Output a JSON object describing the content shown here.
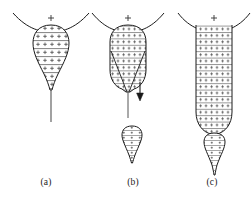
{
  "figure": {
    "title": "",
    "background_color": "#ffffff",
    "stroke_color": "#1a1a1a",
    "hatch_color": "#555555",
    "charge_symbol": "+",
    "panels": [
      {
        "id": "a",
        "label": "(a)",
        "description": "pendant teardrop-shaped charged liquid cone with meniscus above and thin jet tail",
        "meniscus_charge_symbol": "+",
        "has_arrow": false,
        "has_detached_droplet": false,
        "shape": "teardrop",
        "hatch_rows": 9
      },
      {
        "id": "b",
        "label": "(b)",
        "description": "elongated capsule-shaped charged body with internal V-shaped cone lines, downward arrow at jet, and detached droplet below",
        "meniscus_charge_symbol": "+",
        "has_arrow": true,
        "arrow_direction": "down",
        "has_detached_droplet": true,
        "shape": "capsule-with-internal-cone",
        "hatch_rows": 11
      },
      {
        "id": "c",
        "label": "(c)",
        "description": "long vertical charged column with rounded base and smaller hanging teardrop beneath",
        "meniscus_charge_symbol": "+",
        "has_arrow": false,
        "has_detached_droplet": false,
        "has_secondary_drop": true,
        "shape": "column-with-pendant-drop",
        "hatch_rows": 17
      }
    ]
  }
}
